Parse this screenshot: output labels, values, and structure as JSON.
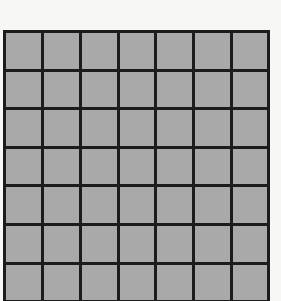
{
  "figure": {
    "columns": 7,
    "rows_visible": 7,
    "colors": {
      "background": "#f7f7f6",
      "cell_fill": "#a9a9a9",
      "grid_line": "#1c1c1c"
    },
    "vertical_lines_x": [
      0,
      38,
      76,
      114,
      151,
      189,
      227,
      264
    ],
    "horizontal_lines_y": [
      0,
      39,
      77,
      116,
      154,
      193,
      232,
      270
    ]
  }
}
